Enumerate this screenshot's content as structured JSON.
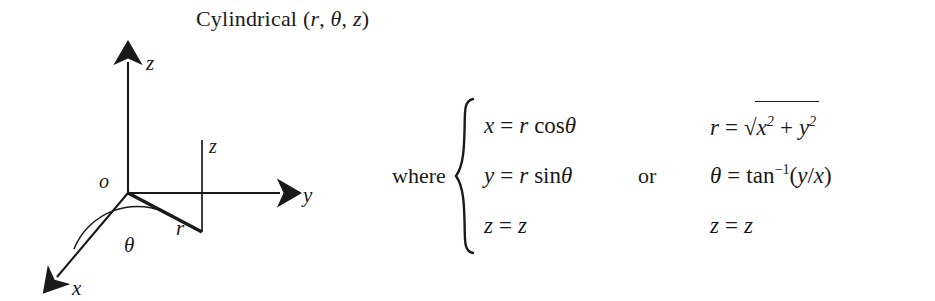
{
  "title": {
    "name": "Cylindrical",
    "open_paren": "(",
    "var_r": "r",
    "comma1": ",",
    "var_theta": "θ",
    "comma2": ",",
    "var_z": "z",
    "close_paren": ")",
    "full_text": "Cylindrical (r, θ, z)"
  },
  "diagram": {
    "axis_labels": {
      "z_axis": "z",
      "y_axis": "y",
      "x_axis": "x",
      "origin": "o",
      "height_segment": "z",
      "radius_segment": "r",
      "angle": "θ"
    },
    "stroke_color": "#1a1a1a"
  },
  "equations": {
    "where_label": "where",
    "or_label": "or",
    "left_system": [
      {
        "lhs": "x",
        "eq": "=",
        "rhs_var": "r",
        "rhs_fn": "cos",
        "rhs_arg": "θ",
        "text": "x = r cosθ"
      },
      {
        "lhs": "y",
        "eq": "=",
        "rhs_var": "r",
        "rhs_fn": "sin",
        "rhs_arg": "θ",
        "text": "y = r sinθ"
      },
      {
        "lhs": "z",
        "eq": "=",
        "rhs_var": "z",
        "rhs_fn": "",
        "rhs_arg": "",
        "text": "z = z"
      }
    ],
    "right_system": [
      {
        "lhs": "r",
        "eq": "=",
        "radical_sign": "√",
        "term1": "x",
        "pow1": "2",
        "plus": "+",
        "term2": "y",
        "pow2": "2",
        "text": "r = √(x² + y²)"
      },
      {
        "lhs": "θ",
        "eq": "=",
        "fn": "tan",
        "exponent": "−1",
        "arg_open": "(",
        "arg_num": "y",
        "arg_slash": "/",
        "arg_den": "x",
        "arg_close": ")",
        "text": "θ = tan⁻¹(y/x)"
      },
      {
        "lhs": "z",
        "eq": "=",
        "rhs": "z",
        "text": "z = z"
      }
    ]
  }
}
